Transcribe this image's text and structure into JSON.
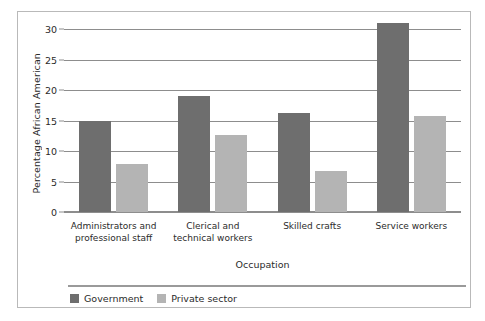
{
  "chart_data": {
    "type": "bar",
    "title": "",
    "xlabel": "Occupation",
    "ylabel": "Percentage African American",
    "categories": [
      "Administrators and professional staff",
      "Clerical and technical workers",
      "Skilled crafts",
      "Service workers"
    ],
    "category_lines": [
      [
        "Administrators and",
        "professional staff"
      ],
      [
        "Clerical and",
        "technical workers"
      ],
      [
        "Skilled crafts"
      ],
      [
        "Service workers"
      ]
    ],
    "series": [
      {
        "name": "Government",
        "color": "#6e6e6e",
        "values": [
          15.0,
          19.0,
          16.2,
          31.0
        ]
      },
      {
        "name": "Private sector",
        "color": "#b4b4b4",
        "values": [
          7.9,
          12.7,
          6.7,
          15.8
        ]
      }
    ],
    "ylim": [
      0,
      30
    ],
    "yticks": [
      0,
      5,
      10,
      15,
      20,
      25,
      30
    ],
    "ytick_labels": [
      "0",
      "5",
      "10",
      "15",
      "20",
      "25",
      "30"
    ],
    "grid": true,
    "legend_position": "bottom-left",
    "colors": {
      "government": "#6e6e6e",
      "private_sector": "#b4b4b4",
      "axis": "#8d8d8d",
      "border": "#b9b9b9",
      "text": "#2b2b2b",
      "background": "#ffffff"
    }
  }
}
